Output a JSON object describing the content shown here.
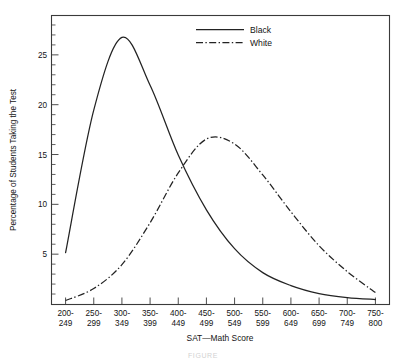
{
  "figure": {
    "caption": "FIGURE",
    "background_color": "#ffffff",
    "line_color": "#232323"
  },
  "chart_data": {
    "type": "line",
    "title": "",
    "xlabel": "SAT—Math Score",
    "ylabel": "Percentage of Students Taking the Test",
    "xlim": [
      0,
      12
    ],
    "ylim": [
      0,
      29
    ],
    "grid": false,
    "legend_position": "top-center",
    "y_ticks_major": [
      5,
      10,
      15,
      20,
      25
    ],
    "y_tick_labels": [
      "5",
      "10",
      "15",
      "20",
      "25"
    ],
    "y_minor_tick_step": 1,
    "categories": [
      "200-249",
      "250-299",
      "300-349",
      "350-399",
      "400-449",
      "450-499",
      "500-549",
      "550-599",
      "600-649",
      "650-699",
      "700-749",
      "750-800"
    ],
    "x_tick_labels": [
      {
        "top": "200-",
        "bottom": "249"
      },
      {
        "top": "250-",
        "bottom": "299"
      },
      {
        "top": "300-",
        "bottom": "349"
      },
      {
        "top": "350-",
        "bottom": "399"
      },
      {
        "top": "400-",
        "bottom": "449"
      },
      {
        "top": "450-",
        "bottom": "499"
      },
      {
        "top": "500-",
        "bottom": "549"
      },
      {
        "top": "550-",
        "bottom": "599"
      },
      {
        "top": "600-",
        "bottom": "649"
      },
      {
        "top": "650-",
        "bottom": "699"
      },
      {
        "top": "700-",
        "bottom": "749"
      },
      {
        "top": "750-",
        "bottom": "800"
      }
    ],
    "series": [
      {
        "name": "Black",
        "style": "solid",
        "values": [
          5.2,
          19.5,
          26.8,
          22.0,
          15.0,
          9.5,
          5.6,
          3.2,
          1.9,
          1.1,
          0.7,
          0.5
        ]
      },
      {
        "name": "White",
        "style": "dash-dot",
        "values": [
          0.4,
          1.6,
          4.0,
          8.2,
          13.2,
          16.6,
          16.1,
          13.0,
          9.3,
          5.9,
          3.3,
          1.2
        ]
      }
    ]
  },
  "legend": {
    "entries": [
      {
        "label": "Black",
        "style": "solid"
      },
      {
        "label": "White",
        "style": "dash-dot"
      }
    ]
  }
}
